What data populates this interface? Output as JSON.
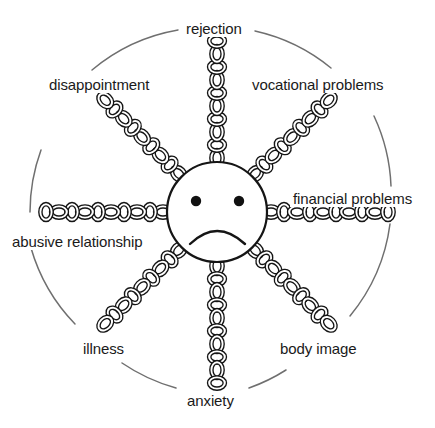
{
  "diagram": {
    "center_figure": "sad-face",
    "outer_ring": "broken circle",
    "stroke_color": "#1a1a1a",
    "ring_color": "#6b6b6b",
    "background_color": "#ffffff",
    "spokes": [
      {
        "id": "rejection",
        "label": "rejection",
        "angle_deg": 270,
        "label_position": "top"
      },
      {
        "id": "vocational",
        "label": "vocational problems",
        "angle_deg": 315,
        "label_position": "upper-right"
      },
      {
        "id": "financial",
        "label": "financial problems",
        "angle_deg": 0,
        "label_position": "right"
      },
      {
        "id": "body-image",
        "label": "body image",
        "angle_deg": 45,
        "label_position": "lower-right"
      },
      {
        "id": "anxiety",
        "label": "anxiety",
        "angle_deg": 90,
        "label_position": "bottom"
      },
      {
        "id": "illness",
        "label": "illness",
        "angle_deg": 135,
        "label_position": "lower-left"
      },
      {
        "id": "abusive",
        "label": "abusive relationship",
        "angle_deg": 180,
        "label_position": "left"
      },
      {
        "id": "disappointment",
        "label": "disappointment",
        "angle_deg": 225,
        "label_position": "upper-left"
      }
    ]
  }
}
